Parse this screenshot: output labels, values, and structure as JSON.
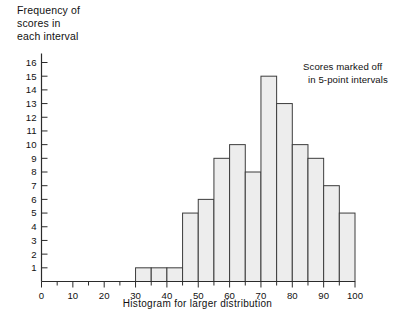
{
  "chart_data": {
    "type": "bar",
    "title": "",
    "xlabel": "Histogram for larger distribution",
    "ylabel": "Frequency of scores in each interval",
    "ylabel_lines": [
      "Frequency of",
      "scores in",
      "each interval"
    ],
    "annotation": "Scores marked off in 5-point intervals",
    "annotation_lines": [
      "Scores marked off",
      "in 5-point intervals"
    ],
    "xlim": [
      0,
      100
    ],
    "ylim": [
      0,
      16
    ],
    "grid": false,
    "legend": null,
    "bin_width": 5,
    "x_tick_step_major": 10,
    "x_tick_step_minor": 5,
    "y_tick_step": 1,
    "xticklabels": [
      "0",
      "10",
      "20",
      "30",
      "40",
      "50",
      "60",
      "70",
      "80",
      "90",
      "100"
    ],
    "xtickvalues": [
      0,
      10,
      20,
      30,
      40,
      50,
      60,
      70,
      80,
      90,
      100
    ],
    "yticklabels": [
      "1",
      "2",
      "3",
      "4",
      "5",
      "6",
      "7",
      "8",
      "9",
      "10",
      "11",
      "12",
      "13",
      "14",
      "15",
      "16"
    ],
    "ytickvalues": [
      1,
      2,
      3,
      4,
      5,
      6,
      7,
      8,
      9,
      10,
      11,
      12,
      13,
      14,
      15,
      16
    ],
    "bin_edges": [
      30,
      35,
      40,
      45,
      50,
      55,
      60,
      65,
      70,
      75,
      80,
      85,
      90,
      95,
      100
    ],
    "categories": [
      "30-35",
      "35-40",
      "40-45",
      "45-50",
      "50-55",
      "55-60",
      "60-65",
      "65-70",
      "70-75",
      "75-80",
      "80-85",
      "85-90",
      "90-95",
      "95-100"
    ],
    "values": [
      1,
      1,
      1,
      5,
      6,
      9,
      10,
      8,
      15,
      13,
      10,
      9,
      7,
      5
    ],
    "bar_fill_color": "#ededed",
    "bar_edge_color": "#3c3c3c",
    "axis_color": "#2b2b2b",
    "text_color": "#111111"
  }
}
